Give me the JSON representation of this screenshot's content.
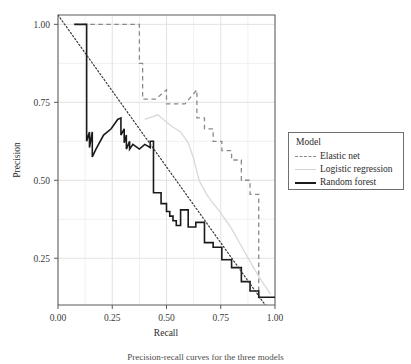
{
  "figure": {
    "caption": "Precision-recall curves for the three models"
  },
  "legend": {
    "title": "Model",
    "entries": [
      {
        "label": "Elastic net",
        "color": "#8a8a8a",
        "style": "dashed",
        "key": "legend-key-elastic-net"
      },
      {
        "label": "Logistic regression",
        "color": "#d3d3d3",
        "style": "solid",
        "key": "legend-key-logistic-regression"
      },
      {
        "label": "Random forest",
        "color": "#1a1a1a",
        "style": "solid",
        "key": "legend-key-random-forest"
      }
    ]
  },
  "chart_data": {
    "type": "line",
    "title": "",
    "xlabel": "Recall",
    "ylabel": "Precision",
    "xlim": [
      0.0,
      1.0
    ],
    "ylim": [
      0.1,
      1.03
    ],
    "grid": true,
    "legend_position": "right",
    "xticks": [
      0.0,
      0.25,
      0.5,
      0.75,
      1.0
    ],
    "xtick_labels": [
      "0.00",
      "0.25",
      "0.50",
      "0.75",
      "1.00"
    ],
    "yticks": [
      0.25,
      0.5,
      0.75,
      1.0
    ],
    "ytick_labels": [
      "0.25",
      "0.50",
      "0.75",
      "1.00"
    ],
    "minor_gridlines_x": [
      0.125,
      0.375,
      0.625,
      0.875
    ],
    "minor_gridlines_y": [
      0.375,
      0.625,
      0.875
    ],
    "annotations": [
      {
        "name": "baseline",
        "type": "dotted-diagonal",
        "from": [
          0.0,
          1.03
        ],
        "to": [
          0.955,
          0.1
        ],
        "color": "#3a3a3a"
      }
    ],
    "series": [
      {
        "name": "Elastic net",
        "color": "#8a8a8a",
        "style": "dashed",
        "points": [
          [
            0.075,
            1.0
          ],
          [
            0.375,
            1.0
          ],
          [
            0.375,
            0.875
          ],
          [
            0.39,
            0.875
          ],
          [
            0.39,
            0.76
          ],
          [
            0.45,
            0.76
          ],
          [
            0.5,
            0.79
          ],
          [
            0.5,
            0.745
          ],
          [
            0.585,
            0.745
          ],
          [
            0.64,
            0.79
          ],
          [
            0.64,
            0.7
          ],
          [
            0.675,
            0.7
          ],
          [
            0.675,
            0.665
          ],
          [
            0.715,
            0.665
          ],
          [
            0.715,
            0.625
          ],
          [
            0.755,
            0.625
          ],
          [
            0.755,
            0.595
          ],
          [
            0.8,
            0.595
          ],
          [
            0.8,
            0.565
          ],
          [
            0.845,
            0.565
          ],
          [
            0.845,
            0.5
          ],
          [
            0.885,
            0.5
          ],
          [
            0.885,
            0.455
          ],
          [
            0.925,
            0.455
          ],
          [
            0.925,
            0.13
          ],
          [
            0.93,
            0.115
          ]
        ]
      },
      {
        "name": "Logistic regression",
        "color": "#d9d9d9",
        "style": "solid",
        "points": [
          [
            0.4,
            0.695
          ],
          [
            0.46,
            0.71
          ],
          [
            0.52,
            0.675
          ],
          [
            0.565,
            0.655
          ],
          [
            0.6,
            0.62
          ],
          [
            0.625,
            0.57
          ],
          [
            0.65,
            0.5
          ],
          [
            0.685,
            0.455
          ],
          [
            0.705,
            0.435
          ],
          [
            0.745,
            0.4
          ],
          [
            0.8,
            0.345
          ],
          [
            0.86,
            0.27
          ],
          [
            0.905,
            0.215
          ],
          [
            0.95,
            0.165
          ],
          [
            0.98,
            0.135
          ]
        ]
      },
      {
        "name": "Random forest",
        "color": "#1a1a1a",
        "style": "solid",
        "points": [
          [
            0.075,
            1.0
          ],
          [
            0.132,
            1.0
          ],
          [
            0.132,
            0.625
          ],
          [
            0.145,
            0.655
          ],
          [
            0.145,
            0.605
          ],
          [
            0.158,
            0.655
          ],
          [
            0.158,
            0.575
          ],
          [
            0.175,
            0.6
          ],
          [
            0.21,
            0.645
          ],
          [
            0.245,
            0.665
          ],
          [
            0.275,
            0.695
          ],
          [
            0.29,
            0.7
          ],
          [
            0.29,
            0.645
          ],
          [
            0.305,
            0.665
          ],
          [
            0.305,
            0.62
          ],
          [
            0.315,
            0.645
          ],
          [
            0.315,
            0.6
          ],
          [
            0.33,
            0.625
          ],
          [
            0.33,
            0.6
          ],
          [
            0.345,
            0.615
          ],
          [
            0.375,
            0.6
          ],
          [
            0.4,
            0.615
          ],
          [
            0.425,
            0.605
          ],
          [
            0.425,
            0.625
          ],
          [
            0.44,
            0.625
          ],
          [
            0.44,
            0.46
          ],
          [
            0.475,
            0.46
          ],
          [
            0.475,
            0.425
          ],
          [
            0.5,
            0.425
          ],
          [
            0.5,
            0.4
          ],
          [
            0.515,
            0.4
          ],
          [
            0.515,
            0.385
          ],
          [
            0.53,
            0.385
          ],
          [
            0.53,
            0.37
          ],
          [
            0.545,
            0.37
          ],
          [
            0.545,
            0.355
          ],
          [
            0.565,
            0.355
          ],
          [
            0.565,
            0.405
          ],
          [
            0.6,
            0.405
          ],
          [
            0.6,
            0.35
          ],
          [
            0.635,
            0.35
          ],
          [
            0.635,
            0.365
          ],
          [
            0.675,
            0.365
          ],
          [
            0.675,
            0.3
          ],
          [
            0.715,
            0.3
          ],
          [
            0.715,
            0.285
          ],
          [
            0.755,
            0.285
          ],
          [
            0.755,
            0.245
          ],
          [
            0.8,
            0.245
          ],
          [
            0.8,
            0.22
          ],
          [
            0.845,
            0.22
          ],
          [
            0.845,
            0.175
          ],
          [
            0.885,
            0.175
          ],
          [
            0.885,
            0.145
          ],
          [
            0.925,
            0.145
          ],
          [
            0.925,
            0.125
          ],
          [
            1.0,
            0.125
          ]
        ]
      }
    ]
  }
}
